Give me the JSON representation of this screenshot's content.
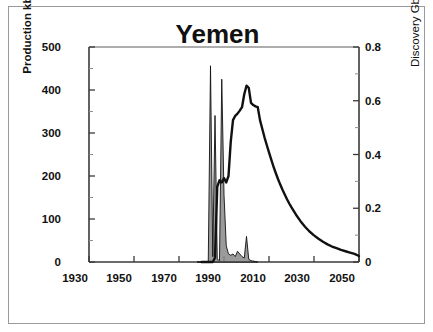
{
  "figure": {
    "title": "Yemen",
    "frame_color": "#9a9a9a",
    "background": "#ffffff",
    "line_color": "#111111",
    "fill_color": "#8a8a8a"
  },
  "axes": {
    "left": {
      "label": "Production kb/d",
      "ticks": [
        "0",
        "100",
        "200",
        "300",
        "400",
        "500"
      ],
      "range": [
        0,
        500
      ],
      "minor_step": 50
    },
    "right": {
      "label": "Discovery Gb (shaded)",
      "ticks": [
        "0",
        "0.2",
        "0.4",
        "0.6",
        "0.8"
      ],
      "range": [
        0,
        0.8
      ],
      "minor_step": 0.1
    },
    "bottom": {
      "label": "",
      "ticks": [
        "1930",
        "1950",
        "1970",
        "1990",
        "2010",
        "2030",
        "2050"
      ],
      "range": [
        1930,
        2050
      ]
    }
  },
  "chart_data": {
    "type": "area",
    "title": "Yemen",
    "xlabel": "",
    "ylabel": "Production kb/d",
    "y2label": "Discovery Gb (shaded)",
    "xlim": [
      1930,
      2050
    ],
    "ylim": [
      0,
      500
    ],
    "y2lim": [
      0,
      0.8
    ],
    "grid": false,
    "legend": "none",
    "series": [
      {
        "name": "Production kb/d",
        "axis": "left",
        "type": "line",
        "x": [
          1980,
          1981,
          1982,
          1983,
          1984,
          1985,
          1986,
          1987,
          1988,
          1989,
          1990,
          1991,
          1992,
          1993,
          1994,
          1995,
          1996,
          1997,
          1998,
          1999,
          2000,
          2001,
          2002,
          2003,
          2004,
          2005,
          2006,
          2007,
          2008,
          2009,
          2010,
          2011,
          2012,
          2013,
          2014,
          2015,
          2016,
          2017,
          2018,
          2019,
          2020,
          2022,
          2024,
          2026,
          2028,
          2030,
          2032,
          2034,
          2036,
          2038,
          2040,
          2042,
          2044,
          2046,
          2048,
          2050
        ],
        "y": [
          0,
          0,
          0,
          0,
          0,
          0,
          10,
          175,
          190,
          185,
          195,
          185,
          200,
          280,
          330,
          340,
          345,
          352,
          360,
          390,
          410,
          405,
          370,
          365,
          362,
          360,
          330,
          310,
          290,
          272,
          255,
          238,
          222,
          207,
          193,
          180,
          168,
          157,
          146,
          136,
          127,
          110,
          95,
          82,
          71,
          62,
          54,
          47,
          41,
          36,
          32,
          28,
          25,
          22,
          19,
          14
        ]
      },
      {
        "name": "Discovery Gb (shaded)",
        "axis": "right",
        "type": "area",
        "x": [
          1978,
          1983,
          1984,
          1985,
          1986,
          1987,
          1988,
          1989,
          1990,
          1991,
          1992,
          1993,
          1994,
          1995,
          1996,
          1997,
          1998,
          1999,
          2000,
          2001,
          2002,
          2005
        ],
        "y": [
          0,
          0,
          0.73,
          0.02,
          0.545,
          0.01,
          0.005,
          0.68,
          0.25,
          0.06,
          0.03,
          0.025,
          0.03,
          0.02,
          0.04,
          0.03,
          0.02,
          0.015,
          0.095,
          0.01,
          0.005,
          0.0
        ]
      }
    ],
    "discovery_spikes": [
      {
        "year": 1984,
        "value_gb": 0.73
      },
      {
        "year": 1986,
        "value_gb": 0.545
      },
      {
        "year": 1989,
        "value_gb": 0.68
      },
      {
        "year": 2000,
        "value_gb": 0.095
      }
    ],
    "production_peak": {
      "year": 2000,
      "value_kbd": 410
    }
  }
}
